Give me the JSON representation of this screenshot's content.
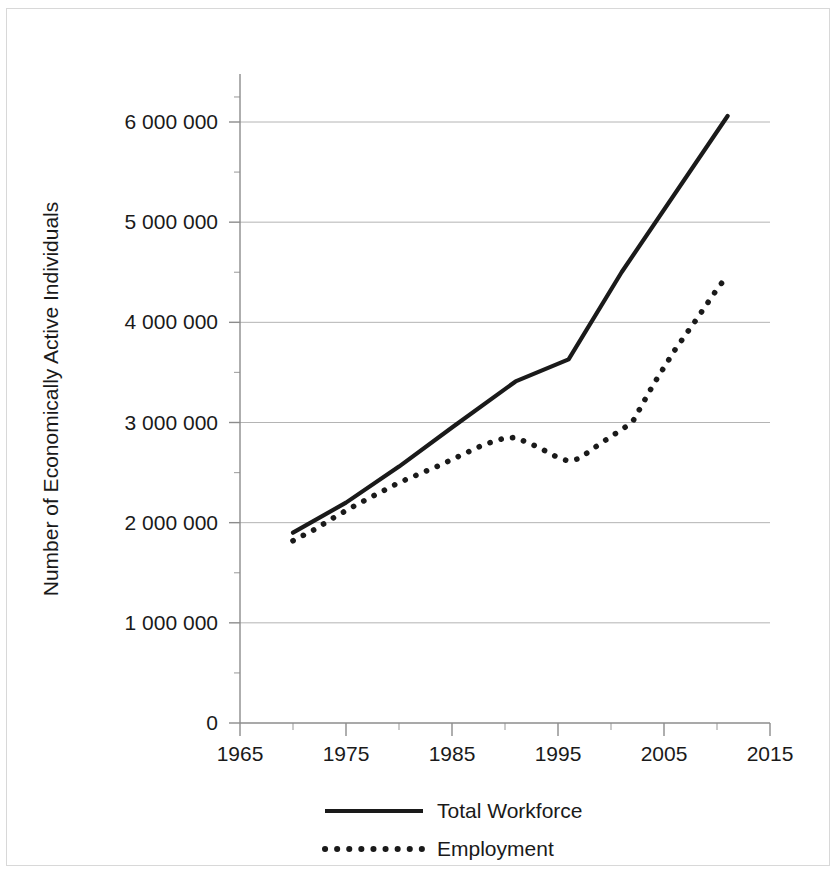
{
  "chart_data": {
    "type": "line",
    "title": "",
    "xlabel": "",
    "ylabel": "Number of Economically Active Individuals",
    "xlim": [
      1965,
      2015
    ],
    "ylim": [
      0,
      6500000
    ],
    "grid": true,
    "legend_position": "bottom",
    "x_tick_labels": [
      "1965",
      "1975",
      "1985",
      "1995",
      "2005",
      "2015"
    ],
    "x_ticks": [
      1965,
      1975,
      1985,
      1995,
      2005,
      2015
    ],
    "x_minor_ticks": [
      1970,
      1980,
      1990,
      2000,
      2010
    ],
    "y_tick_labels": [
      "0",
      "1 000 000",
      "2 000 000",
      "3 000 000",
      "4 000 000",
      "5 000 000",
      "6 000 000"
    ],
    "y_ticks": [
      0,
      1000000,
      2000000,
      3000000,
      4000000,
      5000000,
      6000000
    ],
    "y_minor_ticks": [
      500000,
      1500000,
      2500000,
      3500000,
      4500000,
      5500000,
      6250000
    ],
    "series": [
      {
        "name": "Total Workforce",
        "style": "solid",
        "x": [
          1970,
          1975,
          1980,
          1985,
          1991,
          1996,
          2001,
          2011
        ],
        "values": [
          1900000,
          2200000,
          2560000,
          2950000,
          3410000,
          3630000,
          4500000,
          6060000
        ]
      },
      {
        "name": "Employment",
        "style": "dotted",
        "x": [
          1970,
          1972,
          1974,
          1976,
          1978,
          1980,
          1982,
          1984,
          1986,
          1988,
          1990,
          1991,
          1993,
          1995,
          1996,
          1997,
          1999,
          2001,
          2002,
          2004,
          2006,
          2008,
          2010,
          2011
        ],
        "values": [
          1820000,
          1930000,
          2060000,
          2180000,
          2290000,
          2400000,
          2490000,
          2580000,
          2680000,
          2780000,
          2845000,
          2850000,
          2760000,
          2650000,
          2615000,
          2640000,
          2790000,
          2930000,
          3000000,
          3380000,
          3720000,
          4020000,
          4330000,
          4470000
        ]
      }
    ],
    "legend": [
      {
        "label": "Total Workforce",
        "style": "solid"
      },
      {
        "label": "Employment",
        "style": "dotted"
      }
    ]
  },
  "figure": {
    "width": 839,
    "height": 875,
    "background": "#ffffff",
    "ink_color": "#1a1a1a",
    "grid_color": "#b4b4b4",
    "axis_color": "#8c8c8c"
  }
}
